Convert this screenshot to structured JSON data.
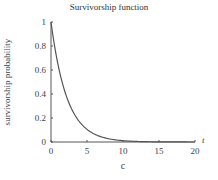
{
  "chart_data": {
    "type": "line",
    "title": "Survivorship function",
    "xlabel": "c",
    "ylabel": "survivorship probability",
    "x_axis_end_label": "t",
    "xlim": [
      0,
      20
    ],
    "ylim": [
      0,
      1
    ],
    "xticks": [
      0,
      5,
      10,
      15,
      20
    ],
    "yticks": [
      0,
      0.2,
      0.4,
      0.6,
      0.8,
      1
    ],
    "ytick_labels": [
      "0",
      "0.2",
      "0.4",
      "0.6",
      "0.8",
      "1"
    ],
    "grid": false,
    "legend": null,
    "series": [
      {
        "name": "survivorship",
        "function": "exp(-0.45 t)",
        "x": [
          0,
          1,
          2,
          3,
          4,
          5,
          6,
          7,
          8,
          9,
          10,
          12,
          14,
          16,
          18,
          20
        ],
        "y": [
          1.0,
          0.64,
          0.41,
          0.26,
          0.17,
          0.11,
          0.07,
          0.04,
          0.03,
          0.02,
          0.01,
          0.005,
          0.002,
          0.001,
          0.0,
          0.0
        ],
        "color": "#555555"
      }
    ]
  }
}
